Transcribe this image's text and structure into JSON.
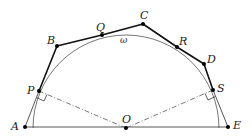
{
  "diagram": {
    "type": "geometry",
    "circle_label": "ω",
    "points": {
      "A": "A",
      "B": "B",
      "C": "C",
      "D": "D",
      "E": "E",
      "O": "O",
      "P": "P",
      "Q": "Q",
      "R": "R",
      "S": "S"
    },
    "polyline_order": [
      "A",
      "P",
      "B",
      "Q",
      "C",
      "R",
      "D",
      "S",
      "E"
    ],
    "right_angle_marks": [
      "P",
      "S"
    ],
    "dashed_segments": [
      [
        "O",
        "P"
      ],
      [
        "O",
        "S"
      ]
    ],
    "colors": {
      "stroke": "#222222",
      "arc": "#666666",
      "dash": "#555555"
    }
  }
}
